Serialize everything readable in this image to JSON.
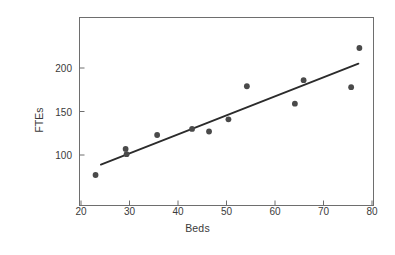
{
  "chart_data": {
    "type": "scatter",
    "title": "",
    "xlabel": "Beds",
    "ylabel": "FTEs",
    "xlim": [
      20,
      80
    ],
    "ylim": [
      60,
      240
    ],
    "xticks": [
      20,
      30,
      40,
      50,
      60,
      70,
      80
    ],
    "yticks": [
      100,
      150,
      200
    ],
    "grid": false,
    "legend": null,
    "marker_color": "#4a4a4a",
    "line_color": "#2b2b2b",
    "axis_color": "#6e6e6e",
    "background": "#ffffff",
    "points": [
      {
        "x": 23.0,
        "y": 77
      },
      {
        "x": 29.2,
        "y": 107
      },
      {
        "x": 29.4,
        "y": 101
      },
      {
        "x": 35.7,
        "y": 123
      },
      {
        "x": 42.9,
        "y": 130
      },
      {
        "x": 46.4,
        "y": 127
      },
      {
        "x": 50.4,
        "y": 141
      },
      {
        "x": 54.2,
        "y": 179
      },
      {
        "x": 64.1,
        "y": 159
      },
      {
        "x": 65.9,
        "y": 186
      },
      {
        "x": 75.7,
        "y": 178
      },
      {
        "x": 77.4,
        "y": 223
      }
    ],
    "fit_line": {
      "label": "least-squares fit",
      "x_start": 24.1,
      "y_start": 89,
      "x_end": 77.2,
      "y_end": 205
    }
  },
  "axes": {
    "xlabel": "Beds",
    "ylabel": "FTEs",
    "xtick_labels": [
      "20",
      "30",
      "40",
      "50",
      "60",
      "70",
      "80"
    ],
    "ytick_labels": [
      "100",
      "150",
      "200"
    ]
  }
}
